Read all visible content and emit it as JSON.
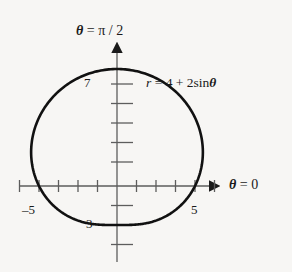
{
  "figure": {
    "background_color": "#f7f6f4",
    "ink_color": "#1a1a1a",
    "width": 292,
    "height": 272
  },
  "labels": {
    "vertical_axis": {
      "theta": "θ",
      "equals": " = ",
      "value": "π / 2",
      "full": "θ = π/2"
    },
    "horizontal_axis": {
      "theta": "θ",
      "equals": " = ",
      "value": "0",
      "full": "θ = 0"
    },
    "equation": {
      "r": "r",
      "equals": " = ",
      "constant": "4",
      "plus": " + ",
      "coefficient": "2",
      "function": "sin",
      "variable": "θ",
      "full": "r = 4 + 2 sin θ"
    },
    "ticks": {
      "top": "7",
      "bottom": "3",
      "left": "–5",
      "right": "5"
    }
  },
  "chart_data": {
    "type": "line",
    "title": "",
    "subtitle": "",
    "coordinate_system": "polar",
    "equation": "r = 4 + 2 sin θ",
    "curve_name": "limacon",
    "parameters": {
      "a": 4,
      "b": 2,
      "trig": "sin"
    },
    "xlabel": "θ = 0",
    "ylabel": "θ = π/2",
    "xlim": [
      -5,
      5
    ],
    "ylim": [
      -3,
      7
    ],
    "grid": false,
    "legend": "none",
    "annotations": [
      {
        "text": "r = 4 + 2 sin θ",
        "x": 2.0,
        "y": 5.6
      }
    ],
    "axis_tick_labels": {
      "x": [
        {
          "value": -5,
          "text": "–5"
        },
        {
          "value": 5,
          "text": "5"
        }
      ],
      "y": [
        {
          "value": 7,
          "text": "7"
        },
        {
          "value": -3,
          "text": "3"
        }
      ]
    },
    "x_ticks": [
      -5,
      -4,
      -3,
      -2,
      -1,
      1,
      2,
      3,
      4,
      5
    ],
    "y_ticks": [
      -3,
      -2,
      -1,
      1,
      2,
      3,
      4,
      5,
      6,
      7
    ],
    "key_points": [
      {
        "theta_deg": 0,
        "r": 4,
        "x": 4,
        "y": 0
      },
      {
        "theta_deg": 90,
        "r": 6,
        "x": 0,
        "y": 6
      },
      {
        "theta_deg": 180,
        "r": 4,
        "x": -4,
        "y": 0
      },
      {
        "theta_deg": 270,
        "r": 2,
        "x": 0,
        "y": -2
      }
    ],
    "series": [
      {
        "name": "r = 4 + 2 sin θ",
        "theta_deg": [
          0,
          15,
          30,
          45,
          60,
          75,
          90,
          105,
          120,
          135,
          150,
          165,
          180,
          195,
          210,
          225,
          240,
          255,
          270,
          285,
          300,
          315,
          330,
          345,
          360
        ],
        "r": [
          4.0,
          4.52,
          5.0,
          5.41,
          5.73,
          5.93,
          6.0,
          5.93,
          5.73,
          5.41,
          5.0,
          4.52,
          4.0,
          3.48,
          3.0,
          2.59,
          2.27,
          2.07,
          2.0,
          2.07,
          2.27,
          2.59,
          3.0,
          3.48,
          4.0
        ]
      }
    ]
  }
}
